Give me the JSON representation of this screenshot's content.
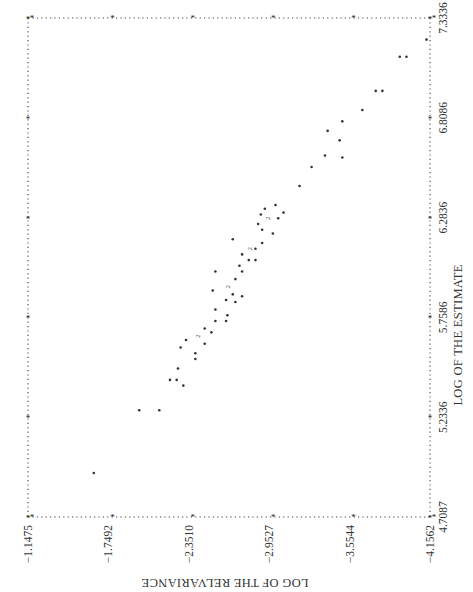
{
  "chart_data": {
    "type": "scatter",
    "orientation_note": "figure printed rotated 90 degrees clockwise",
    "title": "",
    "xlabel": "LOG OF THE ESTIMATE",
    "ylabel": "LOG OF THE RELVARIANCE",
    "xlim": [
      4.7087,
      7.3336
    ],
    "ylim": [
      -4.1562,
      -1.1475
    ],
    "x_ticks": [
      "4.7087",
      "5.2336",
      "5.7586",
      "6.2836",
      "6.8086",
      "7.3336"
    ],
    "y_ticks": [
      "-1.1475",
      "-1.7492",
      "-2.3510",
      "-2.9527",
      "-3.5544",
      "-4.1562"
    ],
    "grid": false,
    "legend": null,
    "point_marker": "*",
    "overlap_marker": "2",
    "points": [
      {
        "x": 4.94,
        "y": -1.64
      },
      {
        "x": 5.27,
        "y": -1.98
      },
      {
        "x": 5.27,
        "y": -2.13
      },
      {
        "x": 5.43,
        "y": -2.21
      },
      {
        "x": 5.43,
        "y": -2.26
      },
      {
        "x": 5.4,
        "y": -2.31
      },
      {
        "x": 5.49,
        "y": -2.27
      },
      {
        "x": 5.54,
        "y": -2.4
      },
      {
        "x": 5.57,
        "y": -2.4
      },
      {
        "x": 5.6,
        "y": -2.29
      },
      {
        "x": 5.64,
        "y": -2.33
      },
      {
        "x": 5.62,
        "y": -2.47
      },
      {
        "x": 5.66,
        "y": -2.41,
        "count": 2
      },
      {
        "x": 5.68,
        "y": -2.52
      },
      {
        "x": 5.7,
        "y": -2.47
      },
      {
        "x": 5.74,
        "y": -2.55
      },
      {
        "x": 5.77,
        "y": -2.64
      },
      {
        "x": 5.8,
        "y": -2.55
      },
      {
        "x": 5.74,
        "y": -2.63
      },
      {
        "x": 5.84,
        "y": -2.7
      },
      {
        "x": 5.85,
        "y": -2.63
      },
      {
        "x": 5.87,
        "y": -2.75
      },
      {
        "x": 5.92,
        "y": -2.64,
        "count": 2
      },
      {
        "x": 5.96,
        "y": -2.7
      },
      {
        "x": 5.88,
        "y": -2.68
      },
      {
        "x": 6.0,
        "y": -2.75
      },
      {
        "x": 6.0,
        "y": -2.55
      },
      {
        "x": 5.9,
        "y": -2.53
      },
      {
        "x": 6.03,
        "y": -2.73
      },
      {
        "x": 6.06,
        "y": -2.85
      },
      {
        "x": 6.06,
        "y": -2.8
      },
      {
        "x": 6.09,
        "y": -2.75
      },
      {
        "x": 6.12,
        "y": -2.85
      },
      {
        "x": 6.15,
        "y": -2.9
      },
      {
        "x": 6.12,
        "y": -2.8,
        "count": 2
      },
      {
        "x": 6.17,
        "y": -2.68
      },
      {
        "x": 6.2,
        "y": -2.98
      },
      {
        "x": 6.22,
        "y": -2.9
      },
      {
        "x": 6.25,
        "y": -2.87
      },
      {
        "x": 6.28,
        "y": -2.94,
        "count": 2
      },
      {
        "x": 6.3,
        "y": -2.89
      },
      {
        "x": 6.33,
        "y": -2.92
      },
      {
        "x": 6.35,
        "y": -3.0
      },
      {
        "x": 6.31,
        "y": -3.06
      },
      {
        "x": 6.28,
        "y": -3.02
      },
      {
        "x": 6.45,
        "y": -3.18
      },
      {
        "x": 6.55,
        "y": -3.27
      },
      {
        "x": 6.61,
        "y": -3.37
      },
      {
        "x": 6.74,
        "y": -3.39
      },
      {
        "x": 6.69,
        "y": -3.48
      },
      {
        "x": 6.6,
        "y": -3.5
      },
      {
        "x": 6.79,
        "y": -3.5
      },
      {
        "x": 6.85,
        "y": -3.65
      },
      {
        "x": 6.95,
        "y": -3.75
      },
      {
        "x": 6.95,
        "y": -3.8
      },
      {
        "x": 7.13,
        "y": -3.93
      },
      {
        "x": 7.13,
        "y": -3.98
      },
      {
        "x": 7.22,
        "y": -4.13
      }
    ]
  },
  "axes": {
    "x_title": "LOG OF THE ESTIMATE",
    "y_title": "LOG OF THE RELVARIANCE",
    "x_ticks": [
      "4.7087",
      "5.2336",
      "5.7586",
      "6.2836",
      "6.8086",
      "7.3336"
    ],
    "y_ticks": [
      "−1.1475",
      "−1.7492",
      "−2.3510",
      "−2.9527",
      "−3.5544",
      "−4.1562"
    ]
  }
}
